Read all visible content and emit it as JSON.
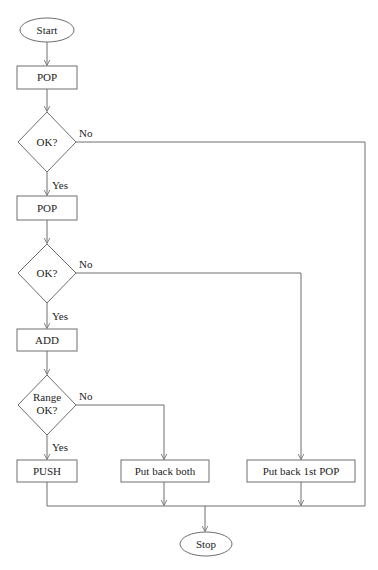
{
  "diagram": {
    "type": "flowchart",
    "nodes": {
      "start": {
        "label": "Start",
        "shape": "ellipse"
      },
      "pop1": {
        "label": "POP",
        "shape": "rect"
      },
      "ok1": {
        "label": "OK?",
        "shape": "diamond"
      },
      "pop2": {
        "label": "POP",
        "shape": "rect"
      },
      "ok2": {
        "label": "OK?",
        "shape": "diamond"
      },
      "add": {
        "label": "ADD",
        "shape": "rect"
      },
      "range_ok": {
        "label_line1": "Range",
        "label_line2": "OK?",
        "shape": "diamond"
      },
      "push": {
        "label": "PUSH",
        "shape": "rect"
      },
      "put_back_both": {
        "label": "Put back both",
        "shape": "rect"
      },
      "put_back_first": {
        "label": "Put back 1st POP",
        "shape": "rect"
      },
      "stop": {
        "label": "Stop",
        "shape": "ellipse"
      }
    },
    "edge_labels": {
      "ok1_no": "No",
      "ok1_yes": "Yes",
      "ok2_no": "No",
      "ok2_yes": "Yes",
      "range_no": "No",
      "range_yes": "Yes"
    },
    "edges": [
      {
        "from": "start",
        "to": "pop1"
      },
      {
        "from": "pop1",
        "to": "ok1"
      },
      {
        "from": "ok1",
        "to": "pop2",
        "label": "Yes"
      },
      {
        "from": "ok1",
        "to": "stop",
        "label": "No"
      },
      {
        "from": "pop2",
        "to": "ok2"
      },
      {
        "from": "ok2",
        "to": "add",
        "label": "Yes"
      },
      {
        "from": "ok2",
        "to": "put_back_first",
        "label": "No"
      },
      {
        "from": "add",
        "to": "range_ok"
      },
      {
        "from": "range_ok",
        "to": "push",
        "label": "Yes"
      },
      {
        "from": "range_ok",
        "to": "put_back_both",
        "label": "No"
      },
      {
        "from": "push",
        "to": "stop"
      },
      {
        "from": "put_back_both",
        "to": "stop"
      },
      {
        "from": "put_back_first",
        "to": "stop"
      }
    ]
  }
}
